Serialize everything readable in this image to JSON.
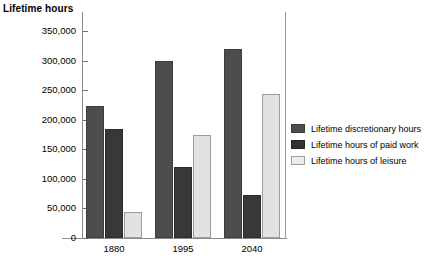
{
  "chart_data": {
    "type": "bar",
    "title": "Lifetime hours",
    "xlabel": "",
    "ylabel": "Lifetime hours",
    "categories": [
      "1880",
      "1995",
      "2040"
    ],
    "series": [
      {
        "name": "Lifetime discretionary hours",
        "color": "#4d4d4d",
        "values": [
          223000,
          300000,
          320000
        ]
      },
      {
        "name": "Lifetime hours of paid work",
        "color": "#383838",
        "values": [
          184000,
          120000,
          73000
        ]
      },
      {
        "name": "Lifetime hours of leisure",
        "color": "#e2e2e2",
        "values": [
          44000,
          175000,
          243000
        ]
      }
    ],
    "ylim": [
      0,
      350000
    ],
    "yticks": [
      0,
      50000,
      100000,
      150000,
      200000,
      250000,
      300000,
      350000
    ],
    "ytick_labels": [
      "0",
      "50,000",
      "100,000",
      "150,000",
      "200,000",
      "250,000",
      "300,000",
      "350,000"
    ],
    "grid": false,
    "legend_position": "right"
  }
}
